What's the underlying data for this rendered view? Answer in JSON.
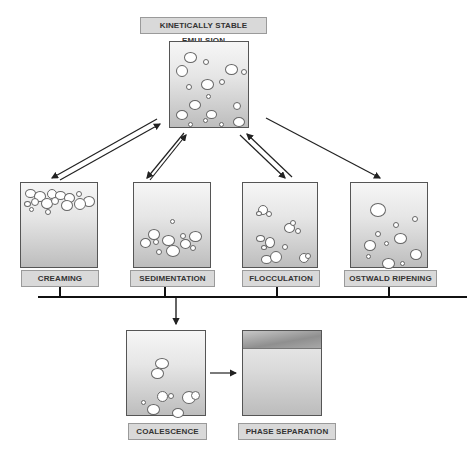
{
  "title": "KINETICALLY STABLE EMULSION",
  "processes": [
    {
      "id": "creaming",
      "label": "CREAMING"
    },
    {
      "id": "sedimentation",
      "label": "SEDIMENTATION"
    },
    {
      "id": "flocculation",
      "label": "FLOCCULATION"
    },
    {
      "id": "ostwald",
      "label": "OSTWALD RIPENING"
    }
  ],
  "outcomes": [
    {
      "id": "coalescence",
      "label": "COALESCENCE"
    },
    {
      "id": "phase_separation",
      "label": "PHASE SEPARATION"
    }
  ],
  "colors": {
    "label_bg": "#d9d9d9",
    "border": "#555555",
    "arrow": "#222222"
  }
}
